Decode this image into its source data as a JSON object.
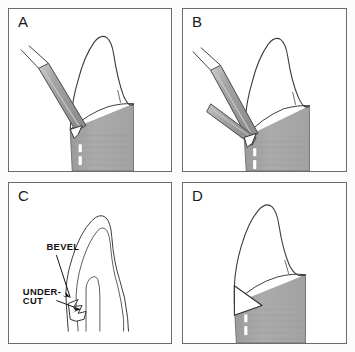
{
  "figure": {
    "background_color": "#fcfcfc",
    "panel_border_color": "#6b6b6b",
    "tooth_outline_color": "#3a3a3a",
    "root_fill_color": "#a8a8a8",
    "instrument_fill_color": "#9e9e9e",
    "instrument_outline_color": "#4a4a4a",
    "panels": [
      {
        "id": "panel-a",
        "letter": "A",
        "description": "Single bur angled against the cervical tooth margin"
      },
      {
        "id": "panel-b",
        "letter": "B",
        "description": "Two burs angled against the cervical tooth margin"
      },
      {
        "id": "panel-c",
        "letter": "C",
        "description": "Line cross-section of the tooth showing bevel and undercut labels"
      },
      {
        "id": "panel-d",
        "letter": "D",
        "description": "Finished preparation showing the completed bevel notch"
      }
    ]
  },
  "annotations": {
    "bevel": {
      "label": "BEVEL",
      "x": 38,
      "y": 68
    },
    "undercut": {
      "label_line1": "UNDER-",
      "label_line2": "CUT",
      "x": 14,
      "y1": 113,
      "y2": 123
    }
  }
}
